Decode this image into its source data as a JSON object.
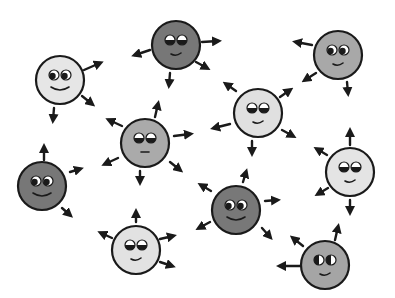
{
  "illustration": {
    "title": "",
    "background": "#ffffff",
    "stroke_color": "#1a1a1a",
    "faces": [
      {
        "id": "face-1",
        "cx": 60,
        "cy": 80,
        "r": 24,
        "fill": "#e6e6e6",
        "shade": "light",
        "eyes": "looking-right",
        "mouth": "wide-smile",
        "arrows": [
          [
            84,
            70,
            100,
            63
          ],
          [
            82,
            96,
            92,
            104
          ],
          [
            54,
            108,
            53,
            120
          ]
        ]
      },
      {
        "id": "face-2",
        "cx": 176,
        "cy": 45,
        "r": 24,
        "fill": "#777777",
        "shade": "dark",
        "eyes": "half-closed",
        "mouth": "small-smile",
        "arrows": [
          [
            150,
            50,
            135,
            55
          ],
          [
            202,
            42,
            218,
            41
          ],
          [
            196,
            62,
            207,
            68
          ],
          [
            170,
            73,
            169,
            85
          ]
        ]
      },
      {
        "id": "face-3",
        "cx": 338,
        "cy": 55,
        "r": 24,
        "fill": "#a8a8a8",
        "shade": "mid",
        "eyes": "looking-right",
        "mouth": "small-smile",
        "arrows": [
          [
            312,
            45,
            296,
            42
          ],
          [
            316,
            73,
            305,
            80
          ],
          [
            347,
            82,
            348,
            93
          ]
        ]
      },
      {
        "id": "face-4",
        "cx": 258,
        "cy": 113,
        "r": 24,
        "fill": "#e0e0e0",
        "shade": "light",
        "eyes": "half-closed",
        "mouth": "small-smile",
        "arrows": [
          [
            236,
            91,
            226,
            84
          ],
          [
            280,
            97,
            290,
            90
          ],
          [
            282,
            130,
            293,
            136
          ],
          [
            252,
            141,
            252,
            153
          ],
          [
            230,
            124,
            214,
            128
          ]
        ]
      },
      {
        "id": "face-5",
        "cx": 145,
        "cy": 143,
        "r": 24,
        "fill": "#aaaaaa",
        "shade": "mid",
        "eyes": "half-closed",
        "mouth": "flat",
        "arrows": [
          [
            122,
            126,
            109,
            120
          ],
          [
            155,
            117,
            158,
            104
          ],
          [
            174,
            136,
            190,
            134
          ],
          [
            170,
            162,
            180,
            170
          ],
          [
            140,
            171,
            140,
            182
          ],
          [
            118,
            158,
            105,
            164
          ]
        ]
      },
      {
        "id": "face-6",
        "cx": 350,
        "cy": 172,
        "r": 24,
        "fill": "#e4e4e4",
        "shade": "light",
        "eyes": "half-closed",
        "mouth": "small-smile",
        "arrows": [
          [
            327,
            155,
            317,
            149
          ],
          [
            350,
            145,
            350,
            131
          ],
          [
            328,
            188,
            318,
            194
          ],
          [
            350,
            200,
            350,
            212
          ]
        ]
      },
      {
        "id": "face-7",
        "cx": 42,
        "cy": 186,
        "r": 24,
        "fill": "#777777",
        "shade": "dark",
        "eyes": "looking-right",
        "mouth": "wide-smile",
        "arrows": [
          [
            44,
            160,
            44,
            147
          ],
          [
            70,
            172,
            80,
            169
          ],
          [
            62,
            208,
            70,
            215
          ]
        ]
      },
      {
        "id": "face-8",
        "cx": 236,
        "cy": 210,
        "r": 24,
        "fill": "#787878",
        "shade": "dark",
        "eyes": "looking-right",
        "mouth": "wide-smile",
        "arrows": [
          [
            211,
            191,
            201,
            185
          ],
          [
            243,
            182,
            246,
            172
          ],
          [
            265,
            201,
            277,
            200
          ],
          [
            262,
            228,
            270,
            237
          ],
          [
            210,
            222,
            199,
            228
          ]
        ]
      },
      {
        "id": "face-9",
        "cx": 136,
        "cy": 250,
        "r": 24,
        "fill": "#e2e2e2",
        "shade": "light",
        "eyes": "half-closed",
        "mouth": "small-smile",
        "arrows": [
          [
            112,
            238,
            101,
            233
          ],
          [
            136,
            222,
            136,
            212
          ],
          [
            160,
            239,
            173,
            236
          ],
          [
            160,
            262,
            172,
            266
          ]
        ]
      },
      {
        "id": "face-10",
        "cx": 325,
        "cy": 265,
        "r": 24,
        "fill": "#a5a5a5",
        "shade": "mid",
        "eyes": "half-moon",
        "mouth": "small-smile",
        "arrows": [
          [
            300,
            266,
            280,
            266
          ],
          [
            303,
            246,
            293,
            238
          ],
          [
            335,
            240,
            338,
            227
          ]
        ]
      }
    ]
  }
}
